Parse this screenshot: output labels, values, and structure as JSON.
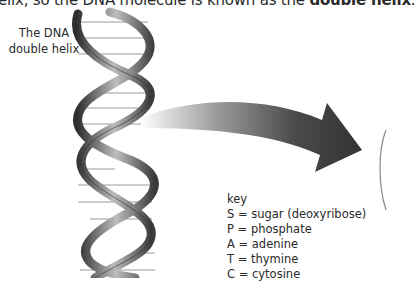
{
  "document": {
    "top_line_prefix": "elix, so the DNA molecule is known as the ",
    "top_line_bold": "double helix",
    "top_line_suffix": ".",
    "figure_label_line1": "The DNA",
    "figure_label_line2": "double helix",
    "key": {
      "title": "key",
      "items": [
        "S = sugar (deoxyribose)",
        "P = phosphate",
        "A = adenine",
        "T = thymine",
        "C = cytosine"
      ]
    },
    "colors": {
      "helix_dark": "#3c3c3c",
      "helix_light": "#d0d0d0",
      "arrow_dark": "#3a3a3a",
      "rung": "#9a9a9a"
    }
  }
}
